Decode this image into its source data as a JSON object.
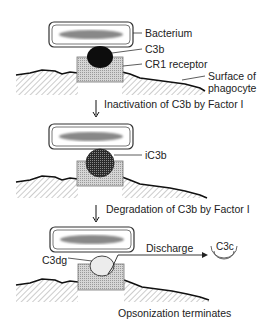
{
  "diagram": {
    "type": "biological-process",
    "stage1": {
      "labels": {
        "bacterium": "Bacterium",
        "c3b": "C3b",
        "receptor": "CR1 receptor",
        "surface_line1": "Surface of",
        "surface_line2": "phagocyte"
      }
    },
    "step1": {
      "label": "Inactivation of C3b by Factor I"
    },
    "stage2": {
      "labels": {
        "ic3b": "iC3b"
      }
    },
    "step2": {
      "label": "Degradation of C3b by Factor I"
    },
    "stage3": {
      "labels": {
        "c3dg": "C3dg",
        "discharge": "Discharge",
        "c3c": "C3c"
      }
    },
    "footer": {
      "label": "Opsonization terminates"
    }
  }
}
